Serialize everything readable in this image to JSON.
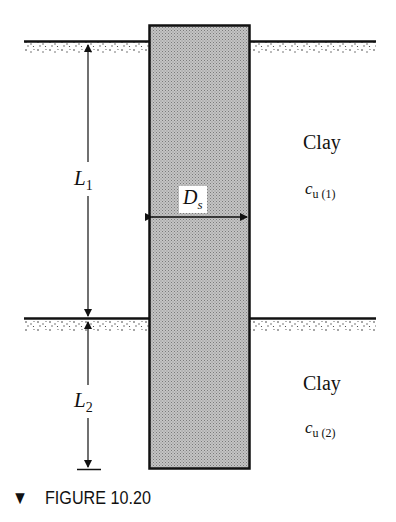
{
  "figure": {
    "caption_marker": "▼",
    "caption": "FIGURE 10.20"
  },
  "layers": [
    {
      "name": "Clay",
      "parameter": "c",
      "parameter_sub": "u (1)",
      "thickness_label": "L",
      "thickness_sub": "1"
    },
    {
      "name": "Clay",
      "parameter": "c",
      "parameter_sub": "u (2)",
      "thickness_label": "L",
      "thickness_sub": "2"
    }
  ],
  "pile": {
    "diameter_label": "D",
    "diameter_sub": "s"
  },
  "colors": {
    "pile_fill": "#b8b8b8",
    "line": "#111111",
    "background": "#ffffff"
  }
}
